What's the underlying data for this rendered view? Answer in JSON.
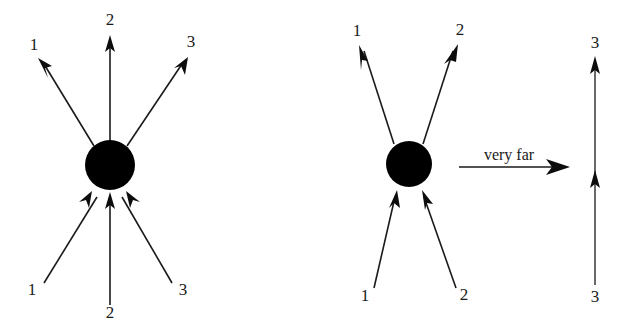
{
  "figure": {
    "background_color": "#ffffff",
    "ink_color": "#000000",
    "annotation_text": "very far",
    "left_diagram": {
      "name": "three-particle vertex",
      "vertex": {
        "cx": 110,
        "cy": 165,
        "r": 25
      },
      "incoming_legs": [
        {
          "label": "1",
          "label_x": 32,
          "label_y": 295,
          "tail_x": 44,
          "tail_y": 283,
          "tip_x": 92,
          "tip_y": 191
        },
        {
          "label": "2",
          "label_x": 110,
          "label_y": 318,
          "tail_x": 110,
          "tail_y": 305,
          "tip_x": 110,
          "tip_y": 192
        },
        {
          "label": "3",
          "label_x": 183,
          "label_y": 295,
          "tail_x": 172,
          "tail_y": 283,
          "tip_x": 126,
          "tip_y": 191
        }
      ],
      "outgoing_legs": [
        {
          "label": "1",
          "label_x": 34,
          "label_y": 50,
          "tail_x": 94,
          "tail_y": 146,
          "tip_x": 38,
          "tip_y": 58
        },
        {
          "label": "2",
          "label_x": 110,
          "label_y": 25,
          "tail_x": 110,
          "tail_y": 148,
          "tip_x": 110,
          "tip_y": 35
        },
        {
          "label": "3",
          "label_x": 191,
          "label_y": 47,
          "tail_x": 127,
          "tail_y": 146,
          "tip_x": 188,
          "tip_y": 57
        }
      ]
    },
    "arrow_annotation": {
      "label": "very far",
      "label_x": 509,
      "label_y": 160,
      "line_x1": 459,
      "line_x2": 566,
      "line_y": 167
    },
    "right_diagram": {
      "name": "two-particle vertex",
      "vertex": {
        "cx": 409,
        "cy": 164,
        "r": 23
      },
      "incoming_legs": [
        {
          "label": "1",
          "label_x": 365,
          "label_y": 301,
          "tail_x": 374,
          "tail_y": 288,
          "tip_x": 397,
          "tip_y": 190
        },
        {
          "label": "2",
          "label_x": 464,
          "label_y": 300,
          "tail_x": 456,
          "tail_y": 288,
          "tip_x": 422,
          "tip_y": 190
        }
      ],
      "outgoing_legs": [
        {
          "label": "1",
          "label_x": 357,
          "label_y": 36,
          "tail_x": 394,
          "tail_y": 144,
          "tip_x": 359,
          "tip_y": 45
        },
        {
          "label": "2",
          "label_x": 460,
          "label_y": 35,
          "tail_x": 423,
          "tail_y": 144,
          "tip_x": 458,
          "tip_y": 44
        }
      ]
    },
    "free_line": {
      "name": "isolated propagator line 3",
      "x": 595,
      "top_label": "3",
      "top_label_x": 595,
      "top_label_y": 48,
      "bottom_label": "3",
      "bottom_label_x": 595,
      "bottom_label_y": 302,
      "line_top_y": 56,
      "line_bottom_y": 285,
      "mid_arrow_y": 170
    }
  }
}
